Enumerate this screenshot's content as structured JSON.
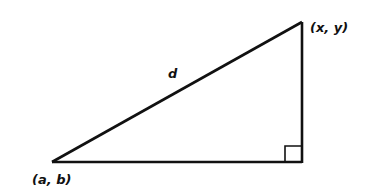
{
  "diagram": {
    "type": "right-triangle-distance",
    "labels": {
      "top_vertex": "(x, y)",
      "bottom_left_vertex": "(a, b)",
      "hypotenuse": "d"
    },
    "vertices": {
      "bottom_left": [
        52,
        162
      ],
      "bottom_right": [
        302,
        162
      ],
      "top": [
        302,
        22
      ]
    },
    "right_angle_marker": true,
    "stroke_color": "#111111"
  }
}
